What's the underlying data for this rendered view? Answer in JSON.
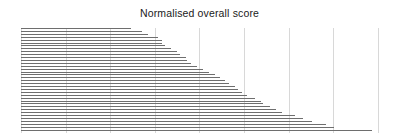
{
  "chart": {
    "title": "Normalised overall score"
  },
  "chart_data": {
    "type": "bar",
    "orientation": "horizontal",
    "title": "Normalised overall score",
    "subtitle": "",
    "xlabel": "",
    "ylabel": "",
    "grid": true,
    "grid_axis": "x",
    "legend": false,
    "legend_position": "none",
    "axis_tick_labels_visible": false,
    "categories": [
      "item-01",
      "item-02",
      "item-03",
      "item-04",
      "item-05",
      "item-06",
      "item-07",
      "item-08",
      "item-09",
      "item-10",
      "item-11",
      "item-12",
      "item-13",
      "item-14",
      "item-15",
      "item-16",
      "item-17",
      "item-18",
      "item-19",
      "item-20",
      "item-21",
      "item-22",
      "item-23",
      "item-24",
      "item-25",
      "item-26",
      "item-27",
      "item-28",
      "item-29",
      "item-30",
      "item-31",
      "item-32",
      "item-33",
      "item-34",
      "item-35",
      "item-36"
    ],
    "values": [
      2.46,
      2.7,
      2.83,
      3.06,
      3.14,
      3.16,
      3.23,
      3.36,
      3.48,
      3.55,
      3.69,
      3.72,
      3.8,
      3.93,
      4.06,
      4.2,
      4.33,
      4.44,
      4.56,
      4.65,
      4.79,
      4.86,
      4.95,
      5.06,
      5.23,
      5.36,
      5.42,
      5.56,
      5.69,
      5.84,
      6.12,
      6.3,
      6.51,
      6.83,
      7.0,
      7.86
    ],
    "xlim": [
      0,
      8
    ],
    "ylim": [
      0,
      36
    ],
    "xticks": [
      0,
      1,
      2,
      3,
      4,
      5,
      6,
      7,
      8
    ],
    "xticklabels": [
      "",
      "",
      "",
      "",
      "",
      "",
      "",
      "",
      ""
    ],
    "bar_color": "#6e6e6e",
    "grid_color": "#d8d8d8",
    "background_color": "#ffffff",
    "title_color": "#1a1a1a"
  },
  "geometry": {
    "plot_left_px": 21,
    "plot_right_px": 378,
    "plot_top_px": 28,
    "plot_bottom_px": 133,
    "gridline_px": [
      21,
      65.6,
      110.2,
      154.8,
      199.4,
      244,
      288.6,
      333.2,
      377.8
    ],
    "row_pitch_px": 2.9,
    "bar_end_px": [
      131.1,
      141.8,
      147.6,
      157.9,
      161.5,
      162.4,
      165.1,
      171.3,
      176.6,
      179.8,
      186.0,
      187.4,
      190.9,
      196.7,
      202.5,
      208.8,
      214.7,
      219.6,
      225.0,
      229.0,
      235.3,
      238.4,
      242.4,
      247.3,
      254.9,
      260.7,
      263.4,
      269.7,
      275.5,
      282.2,
      294.7,
      302.7,
      312.1,
      326.4,
      333.5,
      371.9
    ]
  }
}
